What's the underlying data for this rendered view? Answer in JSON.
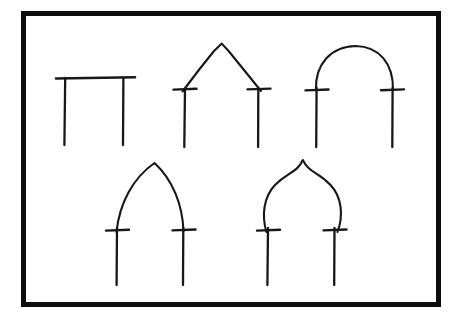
{
  "document": {
    "type": "hand-drawn-diagram",
    "title": "Arch Profile Types",
    "medium": "ink line drawing",
    "background_color": "#ffffff",
    "ink_color": "#171717",
    "frame": {
      "name": "border-frame",
      "color": "#0d0d0d",
      "x": 21,
      "y": 11,
      "width": 420,
      "height": 296,
      "stroke_width": 5
    },
    "layout": {
      "rows": 2,
      "top_row_count": 3,
      "bottom_row_count": 2
    }
  },
  "figures": [
    {
      "id": "arch-1",
      "name": "flat-lintel-arch",
      "label": "Flat lintel (post and beam)",
      "row": 1,
      "position": 1,
      "has_imposts": false,
      "crown_x": 95,
      "crown_y": 78,
      "span_left_x": 65,
      "span_right_x": 123,
      "springing_y": 78,
      "leg_bottom_y": 145,
      "profile_path": "M 56,78.5 L 135,77.2",
      "leg_left_path": "M 65.2,78 L 64.4,145",
      "leg_right_path": "M 123.4,78 L 123.0,145",
      "impost_left_path": "",
      "impost_right_path": ""
    },
    {
      "id": "arch-2",
      "name": "triangular-gabled-arch",
      "label": "Triangular / gabled arch",
      "row": 1,
      "position": 2,
      "has_imposts": true,
      "crown_x": 222,
      "crown_y": 44,
      "span_left_x": 185,
      "span_right_x": 258,
      "springing_y": 89,
      "leg_bottom_y": 147,
      "profile_path": "M 182.5,91.5 L 200,68.5 L 214,51 L 221.8,43.6 L 229,51.5 L 244,70 L 261,91",
      "leg_left_path": "M 185.0,88.5 L 184.3,147",
      "leg_right_path": "M 258.3,89 L 258.1,147",
      "impost_left_path": "M 173.5,89.6 L 196.5,88.7",
      "impost_right_path": "M 247.5,89.4 L 270.5,88.6"
    },
    {
      "id": "arch-3",
      "name": "semicircular-round-arch",
      "label": "Semicircular (round) arch",
      "row": 1,
      "position": 3,
      "has_imposts": true,
      "crown_x": 355,
      "crown_y": 46,
      "span_left_x": 317,
      "span_right_x": 392,
      "springing_y": 90,
      "leg_bottom_y": 147,
      "profile_path": "M 316.0,90 C 315.0,64 331.0,46.5 355.5,46.0 C 379.0,46.5 393.5,63 393.0,90",
      "leg_left_path": "M 316.6,88 L 316.2,147",
      "leg_right_path": "M 392.6,88 L 392.3,147",
      "impost_left_path": "M 305.5,90.4 L 328.5,89.5",
      "impost_right_path": "M 381.0,90.2 L 404.0,89.4"
    },
    {
      "id": "arch-4",
      "name": "pointed-lancet-arch",
      "label": "Pointed (lancet / Gothic) arch",
      "row": 2,
      "position": 1,
      "has_imposts": true,
      "crown_x": 155,
      "crown_y": 163,
      "span_left_x": 117,
      "span_right_x": 183,
      "springing_y": 230,
      "leg_bottom_y": 285,
      "profile_path": "M 116.5,232 C 119.5,203 133.0,178 154.5,163.0 C 173.0,180 182.5,205 183.5,231",
      "leg_left_path": "M 117.0,228 L 116.6,285",
      "leg_right_path": "M 183.3,228 L 183.0,285",
      "impost_left_path": "M 106.0,230.6 L 129.0,229.7",
      "impost_right_path": "M 172.5,230.4 L 195.5,229.5"
    },
    {
      "id": "arch-5",
      "name": "ogee-onion-arch",
      "label": "Ogee / onion (bulbous) arch",
      "row": 2,
      "position": 2,
      "has_imposts": true,
      "crown_x": 303,
      "crown_y": 160,
      "span_left_x": 268,
      "span_right_x": 334,
      "springing_y": 230,
      "leg_bottom_y": 285,
      "profile_path": "M 266.5,232 C 261.5,216 263.5,197 275.0,185.0 C 287.5,172 297.0,173 302.8,160.0 C 309.0,173 318.5,172 330.5,185.0 C 342.0,197 343.5,216 337.5,232",
      "leg_left_path": "M 268.0,228 L 267.4,285",
      "leg_right_path": "M 334.5,228 L 334.2,285",
      "impost_left_path": "M 257.0,230.6 L 280.0,229.7",
      "impost_right_path": "M 323.5,230.4 L 346.5,229.5"
    }
  ]
}
